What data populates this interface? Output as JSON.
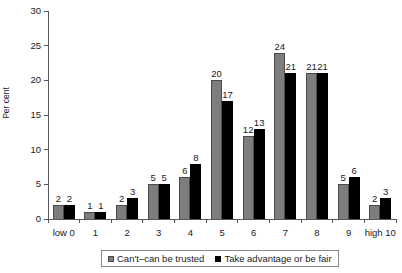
{
  "chart_data": {
    "type": "bar",
    "title": "",
    "xlabel": "",
    "ylabel": "Per cent",
    "ylim": [
      0,
      30
    ],
    "yticks": [
      0,
      5,
      10,
      15,
      20,
      25,
      30
    ],
    "grid": false,
    "legend_position": "bottom",
    "categories": [
      "low 0",
      "1",
      "2",
      "3",
      "4",
      "5",
      "6",
      "7",
      "8",
      "9",
      "high 10"
    ],
    "series": [
      {
        "name": "Can't–can be trusted",
        "color": "#7d7d7d",
        "values": [
          2,
          1,
          2,
          5,
          6,
          20,
          12,
          24,
          21,
          5,
          2
        ]
      },
      {
        "name": "Take advantage or be fair",
        "color": "#000000",
        "values": [
          2,
          1,
          3,
          5,
          8,
          17,
          13,
          21,
          21,
          6,
          3
        ]
      }
    ]
  },
  "axis": {
    "y_title": "Per cent"
  },
  "legend": {
    "items": [
      {
        "label": "Can't–can be trusted",
        "swatch": "gray-square-swatch"
      },
      {
        "label": "Take advantage or be fair",
        "swatch": "black-square-swatch"
      }
    ]
  }
}
